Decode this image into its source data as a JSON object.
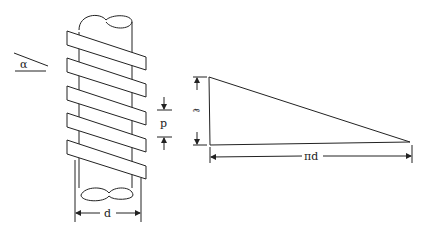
{
  "figure": {
    "labels": {
      "angle": "α",
      "pitch": "p",
      "diameter": "d",
      "lead": "ℓ",
      "circumference": "πd"
    },
    "colors": {
      "stroke": "#222222",
      "background": "#ffffff"
    },
    "band_count": 5
  }
}
